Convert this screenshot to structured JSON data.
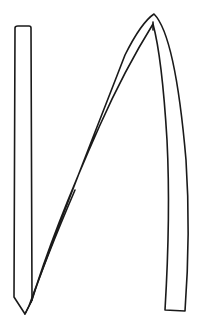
{
  "drawing": {
    "subject": "stylized-letter-N-outline",
    "background": "#ffffff",
    "stroke_color": "#1a1a1a"
  }
}
